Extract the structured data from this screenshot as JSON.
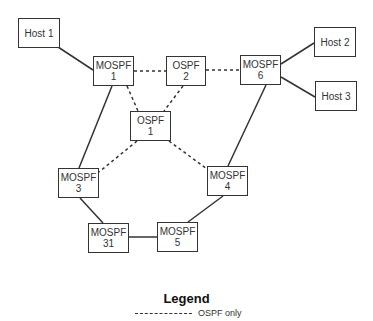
{
  "diagram": {
    "nodes": [
      {
        "id": "host1",
        "line1": "Host 1",
        "line2": "",
        "x": 18,
        "y": 18,
        "w": 42,
        "h": 30
      },
      {
        "id": "mospf1",
        "line1": "MOSPF",
        "line2": "1",
        "x": 93,
        "y": 56,
        "w": 41,
        "h": 30
      },
      {
        "id": "ospf2",
        "line1": "OSPF",
        "line2": "2",
        "x": 166,
        "y": 56,
        "w": 40,
        "h": 30
      },
      {
        "id": "mospf6",
        "line1": "MOSPF",
        "line2": "6",
        "x": 240,
        "y": 55,
        "w": 41,
        "h": 30
      },
      {
        "id": "host2",
        "line1": "Host 2",
        "line2": "",
        "x": 314,
        "y": 27,
        "w": 42,
        "h": 30
      },
      {
        "id": "host3",
        "line1": "Host 3",
        "line2": "",
        "x": 315,
        "y": 81,
        "w": 42,
        "h": 30
      },
      {
        "id": "ospf1",
        "line1": "OSPF",
        "line2": "1",
        "x": 130,
        "y": 111,
        "w": 41,
        "h": 30
      },
      {
        "id": "mospf3",
        "line1": "MOSPF",
        "line2": "3",
        "x": 58,
        "y": 168,
        "w": 41,
        "h": 30
      },
      {
        "id": "mospf4",
        "line1": "MOSPF",
        "line2": "4",
        "x": 207,
        "y": 166,
        "w": 41,
        "h": 30
      },
      {
        "id": "mospf31",
        "line1": "MOSPF",
        "line2": "31",
        "x": 88,
        "y": 223,
        "w": 41,
        "h": 30
      },
      {
        "id": "mospf5",
        "line1": "MOSPF",
        "line2": "5",
        "x": 157,
        "y": 222,
        "w": 41,
        "h": 30
      }
    ],
    "links": [
      {
        "from": "host1",
        "to": "mospf1",
        "style": "solid",
        "x1": 58,
        "y1": 47,
        "x2": 93,
        "y2": 70
      },
      {
        "from": "mospf1",
        "to": "ospf2",
        "style": "dashed",
        "x1": 134,
        "y1": 71,
        "x2": 166,
        "y2": 71
      },
      {
        "from": "ospf2",
        "to": "mospf6",
        "style": "dashed",
        "x1": 206,
        "y1": 70,
        "x2": 240,
        "y2": 70
      },
      {
        "from": "mospf6",
        "to": "host2",
        "style": "solid",
        "x1": 281,
        "y1": 64,
        "x2": 314,
        "y2": 43
      },
      {
        "from": "mospf6",
        "to": "host3",
        "style": "solid",
        "x1": 281,
        "y1": 77,
        "x2": 315,
        "y2": 97
      },
      {
        "from": "mospf1",
        "to": "ospf1",
        "style": "dashed",
        "x1": 127,
        "y1": 86,
        "x2": 138,
        "y2": 111
      },
      {
        "from": "ospf2",
        "to": "ospf1",
        "style": "dashed",
        "x1": 183,
        "y1": 86,
        "x2": 164,
        "y2": 111
      },
      {
        "from": "ospf1",
        "to": "mospf3",
        "style": "dashed",
        "x1": 137,
        "y1": 141,
        "x2": 99,
        "y2": 172
      },
      {
        "from": "ospf1",
        "to": "mospf4",
        "style": "dashed",
        "x1": 169,
        "y1": 141,
        "x2": 207,
        "y2": 169
      },
      {
        "from": "mospf1",
        "to": "mospf3",
        "style": "solid",
        "x1": 112,
        "y1": 86,
        "x2": 79,
        "y2": 168
      },
      {
        "from": "mospf6",
        "to": "mospf4",
        "style": "solid",
        "x1": 266,
        "y1": 85,
        "x2": 228,
        "y2": 166
      },
      {
        "from": "mospf3",
        "to": "mospf31",
        "style": "solid",
        "x1": 80,
        "y1": 198,
        "x2": 103,
        "y2": 223
      },
      {
        "from": "mospf31",
        "to": "mospf5",
        "style": "solid",
        "x1": 129,
        "y1": 237,
        "x2": 157,
        "y2": 237
      },
      {
        "from": "mospf4",
        "to": "mospf5",
        "style": "solid",
        "x1": 223,
        "y1": 196,
        "x2": 188,
        "y2": 222
      }
    ]
  },
  "legend": {
    "title": "Legend",
    "items": [
      {
        "style": "dashed",
        "label": "OSPF only"
      }
    ]
  },
  "colors": {
    "line": "#333333",
    "box_border": "#333333",
    "background": "#ffffff"
  }
}
